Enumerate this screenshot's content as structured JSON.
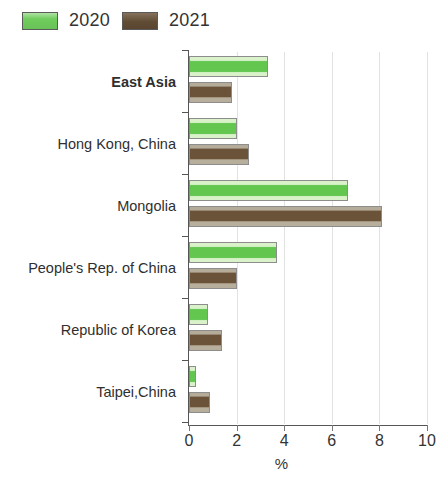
{
  "legend": {
    "items": [
      {
        "label": "2020",
        "color": "#62c64f",
        "swatch": "green"
      },
      {
        "label": "2021",
        "color": "#6b5339",
        "swatch": "brown"
      }
    ]
  },
  "axis": {
    "x_title": "%",
    "x_ticks": [
      "0",
      "2",
      "4",
      "6",
      "8",
      "10"
    ]
  },
  "chart_data": {
    "type": "bar",
    "orientation": "horizontal",
    "title": "",
    "xlabel": "%",
    "ylabel": "",
    "xlim": [
      0,
      10
    ],
    "xticks": [
      0,
      2,
      4,
      6,
      8,
      10
    ],
    "grid": true,
    "legend_position": "top-left",
    "categories": [
      "East Asia",
      "Hong Kong, China",
      "Mongolia",
      "People's Rep. of China",
      "Republic of Korea",
      "Taipei,China"
    ],
    "emphasized_categories": [
      "East Asia"
    ],
    "series": [
      {
        "name": "2020",
        "color": "#62c64f",
        "values": [
          3.3,
          2.0,
          6.7,
          3.7,
          0.8,
          0.3
        ]
      },
      {
        "name": "2021",
        "color": "#6b5339",
        "values": [
          1.8,
          2.5,
          8.1,
          2.0,
          1.4,
          0.9
        ]
      }
    ]
  }
}
